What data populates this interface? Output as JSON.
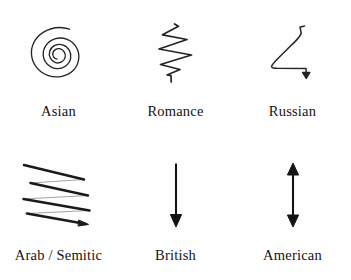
{
  "figure": {
    "background_color": "#fefefe",
    "ink_color": "#1a1a1a",
    "columns": 3,
    "rows": 2,
    "items": [
      {
        "id": "asian",
        "label": "Asian",
        "icon": "spiral-icon",
        "shape": "inward-counterclockwise-spiral",
        "description": "Hand-drawn spiral coiling inward, about two and a half turns",
        "stroke_width": 1.3
      },
      {
        "id": "romance",
        "label": "Romance",
        "icon": "vertical-zigzag-icon",
        "shape": "vertical-zigzag",
        "description": "Hand-drawn vertical zigzag descending with four switchbacks and a short tail",
        "stroke_width": 1.6
      },
      {
        "id": "russian",
        "label": "Russian",
        "icon": "bent-arrow-icon",
        "shape": "z-bend-with-down-arrow",
        "description": "Line from upper right sloping down left, then horizontal right, ending in a small downward arrowhead",
        "stroke_width": 1.5
      },
      {
        "id": "arab-semitic",
        "label": "Arab / Semitic",
        "icon": "horizontal-zigzag-arrow-icon",
        "shape": "stacked-right-to-left-sweeps",
        "description": "Four heavy left-to-right descending strokes joined by faint return lines, ending in an arrowhead at lower right",
        "stroke_width": 2.4
      },
      {
        "id": "british",
        "label": "British",
        "icon": "down-arrow-icon",
        "shape": "straight-down-arrow",
        "description": "Single straight vertical arrow pointing down",
        "stroke_width": 2.0
      },
      {
        "id": "american",
        "label": "American",
        "icon": "double-headed-arrow-icon",
        "shape": "vertical-double-arrow",
        "description": "Straight vertical line with arrowheads at both top and bottom",
        "stroke_width": 2.0
      }
    ]
  }
}
